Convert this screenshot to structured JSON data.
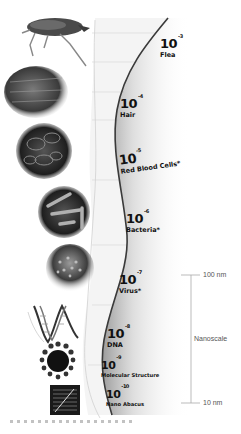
{
  "diagram": {
    "scale_items": [
      {
        "base": "10",
        "exp": "-3",
        "name": "Flea"
      },
      {
        "base": "10",
        "exp": "-4",
        "name": "Hair"
      },
      {
        "base": "10",
        "exp": "-5",
        "name": "Red Blood Cells*"
      },
      {
        "base": "10",
        "exp": "-6",
        "name": "Bacteria*"
      },
      {
        "base": "10",
        "exp": "-7",
        "name": "Virus*"
      },
      {
        "base": "10",
        "exp": "-8",
        "name": "DNA"
      },
      {
        "base": "10",
        "exp": "-9",
        "name": "Molecular Structure"
      },
      {
        "base": "10",
        "exp": "-10",
        "name": "Nano Abacus"
      }
    ],
    "images": [
      {
        "icon": "flea-image"
      },
      {
        "icon": "hair-image"
      },
      {
        "icon": "red-blood-cells-image"
      },
      {
        "icon": "bacteria-image"
      },
      {
        "icon": "virus-image"
      },
      {
        "icon": "dna-image"
      },
      {
        "icon": "molecule-image"
      },
      {
        "icon": "nano-abacus-image"
      }
    ],
    "nanoscale_bracket": {
      "top_label": "100 nm",
      "middle_label": "Nanoscale",
      "bottom_label": "10 nm"
    },
    "colors": {
      "curve": "#3a3a3a",
      "text": "#111111",
      "scale_text": "#555555",
      "bracket_line": "#aaaaaa"
    }
  }
}
